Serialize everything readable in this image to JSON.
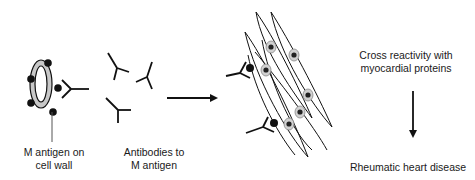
{
  "diagram": {
    "title_cut_off": "",
    "labels": {
      "bacterium": {
        "line1": "M antigen on",
        "line2": "cell wall"
      },
      "antibodies": {
        "line1": "Antibodies to",
        "line2": "M antigen"
      },
      "cross_reactivity": {
        "line1": "Cross reactivity with",
        "line2": "myocardial proteins"
      },
      "outcome": "Rheumatic heart disease"
    },
    "elements": [
      {
        "id": "bacterium",
        "icon": "bacterium-with-m-antigen-icon"
      },
      {
        "id": "free-antibodies",
        "icon": "y-shaped-antibody-icon",
        "count": 3
      },
      {
        "id": "arrow-right",
        "icon": "arrow-right-icon"
      },
      {
        "id": "myocardial-cells",
        "icon": "myocardial-cell-icon",
        "count": 6
      },
      {
        "id": "bound-antibodies",
        "icon": "antibody-bound-to-cell-icon",
        "count": 2
      },
      {
        "id": "arrow-down",
        "icon": "arrow-down-icon"
      }
    ],
    "colors": {
      "stroke": "#111111",
      "bacterium_fill": "#c8c8c8",
      "nucleus_fill": "#d0d0d0",
      "text": "#1a1a1a"
    }
  }
}
